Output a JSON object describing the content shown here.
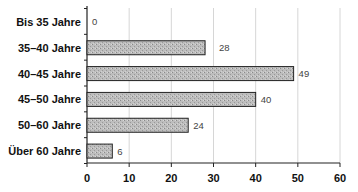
{
  "chart_data": {
    "type": "bar",
    "orientation": "horizontal",
    "title": "",
    "xlabel": "",
    "ylabel": "",
    "categories": [
      "Bis 35 Jahre",
      "35–40 Jahre",
      "40–45 Jahre",
      "45–50 Jahre",
      "50–60 Jahre",
      "Über 60 Jahre"
    ],
    "values": [
      0,
      28,
      49,
      40,
      24,
      6
    ],
    "xlim": [
      0,
      60
    ],
    "xticks": [
      0,
      10,
      20,
      30,
      40,
      50,
      60
    ],
    "grid": "vertical",
    "legend": null,
    "data_labels": true,
    "bar_color": "#b8b8b8",
    "bar_edge_color": "#222222"
  }
}
